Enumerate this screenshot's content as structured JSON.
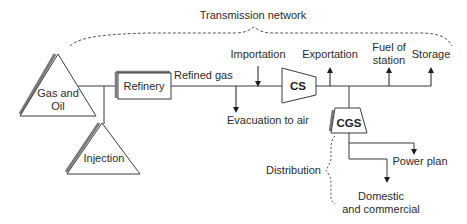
{
  "diagram": {
    "title": "Transmission network",
    "colors": {
      "line": "#3a3a3a",
      "shadow": "#7a7a7a",
      "dashed": "#555555",
      "text": "#2b2b2b",
      "background": "#ffffff"
    },
    "nodes": {
      "gas_oil": {
        "line1": "Gas and",
        "line2": "Oil",
        "shape": "triangle"
      },
      "injection": {
        "label": "Injection",
        "shape": "triangle"
      },
      "refinery": {
        "label": "Refinery",
        "shape": "box"
      },
      "cs": {
        "label": "CS",
        "shape": "trapezoid"
      },
      "cgs": {
        "label": "CGS",
        "shape": "trapezoid"
      }
    },
    "flows": {
      "refined_gas": "Refined gas",
      "evacuation": "Evacuation to air",
      "importation": "Importation",
      "exportation": "Exportation",
      "fuel_line1": "Fuel of",
      "fuel_line2": "station",
      "storage": "Storage",
      "power_plan": "Power plan",
      "domestic_line1": "Domestic",
      "domestic_line2": "and commercial"
    },
    "brackets": {
      "transmission": "Transmission network",
      "distribution": "Distribution"
    }
  }
}
